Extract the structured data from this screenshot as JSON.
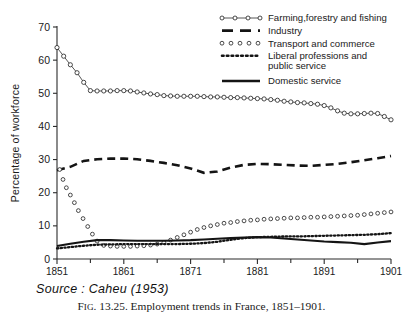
{
  "figure": {
    "source_note": "Source : Caheu (1953)",
    "caption_prefix": "F",
    "caption_smallcaps": "IG",
    "caption_rest": ". 13.25. Employment trends in France, 1851–1901."
  },
  "chart_data": {
    "type": "line",
    "title": "",
    "xlabel": "",
    "ylabel": "Percentage of workforce",
    "xlim": [
      1851,
      1901
    ],
    "ylim": [
      0,
      70
    ],
    "ytick_values": [
      0,
      10,
      20,
      30,
      40,
      50,
      60,
      70
    ],
    "ytick_labels": [
      "0",
      "10",
      "20",
      "30",
      "40",
      "50",
      "60",
      "70"
    ],
    "xtick_values": [
      1851,
      1861,
      1871,
      1881,
      1891,
      1901
    ],
    "xtick_labels": [
      "1851",
      "1861",
      "1871",
      "1881",
      "1891",
      "1901"
    ],
    "xtick_minor_values": [
      1856,
      1866,
      1876,
      1886,
      1896
    ],
    "grid": false,
    "legend_position": "top-right",
    "series": [
      {
        "name": "Farming, forestry and fishing",
        "legend_label": "Farming,forestry and fishing",
        "style": "line-with-open-circles",
        "color": "#2b2b2b",
        "x": [
          1851,
          1852,
          1853,
          1854,
          1855,
          1856,
          1857,
          1858,
          1859,
          1860,
          1861,
          1862,
          1863,
          1864,
          1865,
          1866,
          1867,
          1868,
          1869,
          1870,
          1871,
          1872,
          1873,
          1874,
          1875,
          1876,
          1877,
          1878,
          1879,
          1880,
          1881,
          1882,
          1883,
          1884,
          1885,
          1886,
          1887,
          1888,
          1889,
          1890,
          1891,
          1892,
          1893,
          1894,
          1895,
          1896,
          1897,
          1898,
          1899,
          1900,
          1901
        ],
        "y": [
          63.8,
          61.2,
          58.6,
          56.2,
          53.3,
          50.8,
          50.7,
          50.7,
          50.7,
          50.8,
          50.8,
          50.7,
          50.4,
          50.1,
          49.8,
          49.6,
          49.3,
          49.2,
          49.1,
          49.1,
          49.1,
          49.1,
          49.0,
          48.9,
          48.9,
          48.8,
          48.7,
          48.7,
          48.6,
          48.5,
          48.4,
          48.3,
          48.1,
          47.9,
          47.6,
          47.4,
          47.2,
          47.1,
          46.9,
          46.7,
          46.3,
          45.6,
          44.7,
          44.0,
          43.8,
          43.8,
          43.9,
          44.0,
          43.9,
          43.0,
          42.0
        ]
      },
      {
        "name": "Industry",
        "legend_label": "Industry",
        "style": "thick-dashed",
        "color": "#141414",
        "x": [
          1851,
          1853,
          1855,
          1857,
          1859,
          1861,
          1863,
          1865,
          1867,
          1869,
          1871,
          1873,
          1875,
          1877,
          1879,
          1881,
          1883,
          1885,
          1887,
          1889,
          1891,
          1893,
          1895,
          1897,
          1899,
          1901
        ],
        "y": [
          26.8,
          27.8,
          29.6,
          30.1,
          30.3,
          30.3,
          30.1,
          29.6,
          29.0,
          28.3,
          27.3,
          26.0,
          26.4,
          27.6,
          28.4,
          28.7,
          28.6,
          28.4,
          28.2,
          28.1,
          28.4,
          28.7,
          29.2,
          29.8,
          30.4,
          31.1
        ]
      },
      {
        "name": "Transport and commerce",
        "legend_label": "Transport and commerce",
        "style": "open-circle-dots",
        "color": "#2b2b2b",
        "x": [
          1851.4,
          1851.9,
          1852.4,
          1853.0,
          1853.6,
          1854.2,
          1854.9,
          1855.6,
          1856.3,
          1857.0,
          1858,
          1859,
          1860,
          1861,
          1862,
          1863,
          1864,
          1865,
          1866,
          1867,
          1868,
          1869,
          1870,
          1871,
          1872,
          1873,
          1874,
          1875,
          1876,
          1877,
          1878,
          1879,
          1880,
          1881,
          1882,
          1883,
          1884,
          1885,
          1886,
          1887,
          1888,
          1889,
          1890,
          1891,
          1892,
          1893,
          1894,
          1895,
          1896,
          1897,
          1898,
          1899,
          1900,
          1901
        ],
        "y": [
          27.0,
          24.0,
          21.5,
          19.3,
          17.0,
          14.6,
          12.2,
          9.8,
          7.5,
          5.4,
          4.1,
          3.9,
          3.8,
          3.8,
          3.8,
          3.9,
          4.0,
          4.2,
          4.5,
          5.0,
          5.7,
          6.5,
          7.3,
          8.1,
          8.9,
          9.5,
          10.0,
          10.4,
          10.8,
          11.0,
          11.3,
          11.5,
          11.7,
          11.8,
          12.0,
          12.1,
          12.2,
          12.3,
          12.4,
          12.4,
          12.5,
          12.6,
          12.6,
          12.7,
          12.8,
          12.9,
          13.0,
          13.1,
          13.2,
          13.4,
          13.6,
          13.8,
          14.0,
          14.2
        ]
      },
      {
        "name": "Liberal professions and public service",
        "legend_label_line1": "Liberal professions and",
        "legend_label_line2": "public service",
        "style": "fine-dotted",
        "color": "#141414",
        "x": [
          1851,
          1853,
          1855,
          1857,
          1859,
          1861,
          1863,
          1865,
          1867,
          1869,
          1871,
          1873,
          1875,
          1877,
          1879,
          1881,
          1883,
          1885,
          1887,
          1889,
          1891,
          1893,
          1895,
          1897,
          1899,
          1901
        ],
        "y": [
          3.2,
          3.6,
          4.0,
          4.3,
          4.4,
          4.5,
          4.5,
          4.5,
          4.5,
          4.5,
          4.6,
          4.8,
          5.2,
          5.8,
          6.3,
          6.6,
          6.7,
          6.8,
          6.8,
          6.9,
          7.0,
          7.1,
          7.2,
          7.3,
          7.5,
          7.8
        ]
      },
      {
        "name": "Domestic service",
        "legend_label": "Domestic service",
        "style": "thick-solid",
        "color": "#141414",
        "x": [
          1851,
          1853,
          1855,
          1857,
          1859,
          1861,
          1863,
          1865,
          1867,
          1869,
          1871,
          1873,
          1875,
          1877,
          1879,
          1881,
          1883,
          1885,
          1887,
          1889,
          1891,
          1893,
          1895,
          1897,
          1899,
          1901
        ],
        "y": [
          3.9,
          4.6,
          5.2,
          5.7,
          5.7,
          5.6,
          5.5,
          5.5,
          5.5,
          5.6,
          5.7,
          5.9,
          6.1,
          6.3,
          6.5,
          6.6,
          6.5,
          6.2,
          5.9,
          5.6,
          5.3,
          5.1,
          4.9,
          4.5,
          5.0,
          5.4
        ]
      }
    ],
    "legend_entries": [
      "Farming,forestry and fishing",
      "Industry",
      "Transport and commerce",
      "Liberal professions and public service",
      "Domestic service"
    ]
  }
}
